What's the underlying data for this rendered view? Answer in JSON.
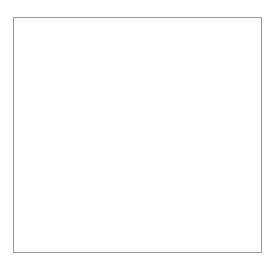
{
  "figure": {
    "type": "network-graph",
    "title": "",
    "background_color": "#ffffff",
    "frame": {
      "visible": true,
      "color": "#9a9a9a",
      "line_width": 1,
      "left": 13,
      "top": 17,
      "right": 262,
      "bottom": 253
    }
  },
  "chart_data": {
    "type": "scatter",
    "render_style": "force-directed-node-link-hairball",
    "title": "",
    "subtitle": "",
    "xlabel": "",
    "ylabel": "",
    "grid": false,
    "legend": null,
    "axis_ticks": [],
    "tick_labels": [],
    "xlim": [
      13,
      262
    ],
    "ylim": [
      17,
      253
    ],
    "node_color": "#3a3a3a",
    "edge_color": "#707070",
    "node_count_estimate": 9000,
    "edge_count_estimate": 14000,
    "blob": {
      "shape": "teardrop",
      "center_x": 131,
      "center_y": 139,
      "radius_x": 76,
      "radius_y": 106,
      "top_y": 33,
      "bottom_y": 245,
      "left_x": 55,
      "right_x": 211
    },
    "hubs": [
      {
        "id": "hub-major-right",
        "x": 168,
        "y": 167,
        "radius": 44,
        "weight": 1.0,
        "spokes": 58,
        "label": ""
      },
      {
        "id": "hub-center",
        "x": 122,
        "y": 146,
        "radius": 20,
        "weight": 0.72,
        "spokes": 26,
        "label": ""
      },
      {
        "id": "hub-upper-center",
        "x": 112,
        "y": 104,
        "radius": 17,
        "weight": 0.66,
        "spokes": 22,
        "label": ""
      },
      {
        "id": "hub-mid-left",
        "x": 84,
        "y": 122,
        "radius": 15,
        "weight": 0.58,
        "spokes": 20,
        "label": ""
      },
      {
        "id": "hub-upper-left",
        "x": 95,
        "y": 88,
        "radius": 12,
        "weight": 0.5,
        "spokes": 16,
        "label": ""
      },
      {
        "id": "hub-upper-right",
        "x": 151,
        "y": 93,
        "radius": 14,
        "weight": 0.54,
        "spokes": 18,
        "label": ""
      },
      {
        "id": "hub-top",
        "x": 127,
        "y": 62,
        "radius": 13,
        "weight": 0.48,
        "spokes": 16,
        "label": ""
      },
      {
        "id": "hub-lower-center",
        "x": 128,
        "y": 186,
        "radius": 12,
        "weight": 0.44,
        "spokes": 14,
        "label": ""
      },
      {
        "id": "hub-lower-left",
        "x": 92,
        "y": 196,
        "radius": 11,
        "weight": 0.4,
        "spokes": 13,
        "label": ""
      },
      {
        "id": "hub-lower-right",
        "x": 167,
        "y": 216,
        "radius": 11,
        "weight": 0.38,
        "spokes": 13,
        "label": ""
      },
      {
        "id": "hub-right-upper",
        "x": 186,
        "y": 131,
        "radius": 11,
        "weight": 0.42,
        "spokes": 14,
        "label": ""
      },
      {
        "id": "hub-far-left",
        "x": 68,
        "y": 160,
        "radius": 10,
        "weight": 0.34,
        "spokes": 11,
        "label": ""
      },
      {
        "id": "hub-bottom",
        "x": 137,
        "y": 224,
        "radius": 9,
        "weight": 0.3,
        "spokes": 10,
        "label": ""
      }
    ],
    "backbone_edges": [
      {
        "from": "hub-mid-left",
        "to": "hub-center",
        "darkness": 0.85
      },
      {
        "from": "hub-center",
        "to": "hub-major-right",
        "darkness": 0.78
      },
      {
        "from": "hub-center",
        "to": "hub-upper-center",
        "darkness": 0.82
      },
      {
        "from": "hub-upper-center",
        "to": "hub-upper-left",
        "darkness": 0.7
      },
      {
        "from": "hub-upper-center",
        "to": "hub-upper-right",
        "darkness": 0.74
      },
      {
        "from": "hub-upper-right",
        "to": "hub-top",
        "darkness": 0.62
      },
      {
        "from": "hub-top",
        "to": "hub-upper-left",
        "darkness": 0.58
      },
      {
        "from": "hub-center",
        "to": "hub-lower-center",
        "darkness": 0.8
      },
      {
        "from": "hub-lower-center",
        "to": "hub-lower-left",
        "darkness": 0.72
      },
      {
        "from": "hub-lower-left",
        "to": "hub-far-left",
        "darkness": 0.6
      },
      {
        "from": "hub-far-left",
        "to": "hub-mid-left",
        "darkness": 0.64
      },
      {
        "from": "hub-lower-center",
        "to": "hub-bottom",
        "darkness": 0.56
      },
      {
        "from": "hub-bottom",
        "to": "hub-lower-right",
        "darkness": 0.52
      },
      {
        "from": "hub-lower-right",
        "to": "hub-major-right",
        "darkness": 0.6
      },
      {
        "from": "hub-major-right",
        "to": "hub-right-upper",
        "darkness": 0.66
      },
      {
        "from": "hub-right-upper",
        "to": "hub-upper-right",
        "darkness": 0.58
      },
      {
        "from": "hub-upper-center",
        "to": "hub-major-right",
        "darkness": 0.68
      },
      {
        "from": "hub-mid-left",
        "to": "hub-upper-left",
        "darkness": 0.62
      }
    ],
    "density_note": "Density highest at center-right around the major hub; periphery fades to sparse light-gray nodes."
  }
}
